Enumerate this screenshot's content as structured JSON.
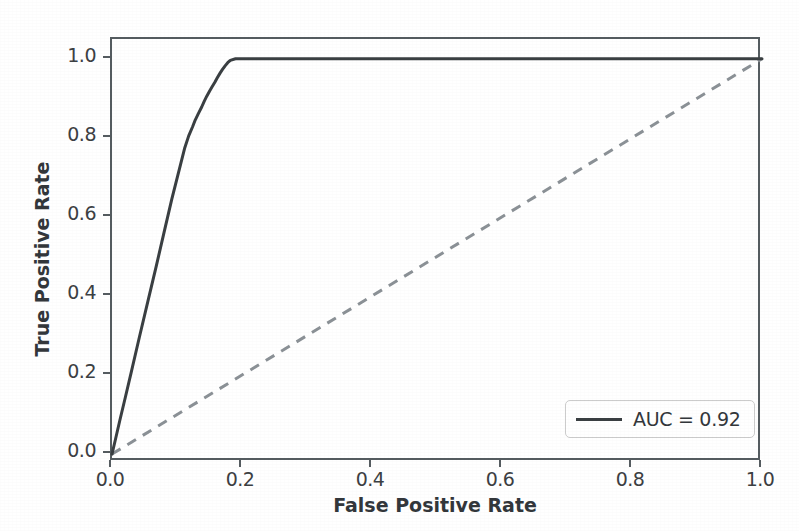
{
  "chart_data": {
    "type": "line",
    "title": "",
    "xlabel": "False Positive Rate",
    "ylabel": "True Positive Rate",
    "xlim": [
      0.0,
      1.0
    ],
    "ylim": [
      -0.02,
      1.05
    ],
    "grid": false,
    "legend_position": "lower right",
    "xticks": [
      "0.0",
      "0.2",
      "0.4",
      "0.6",
      "0.8",
      "1.0"
    ],
    "xtick_values": [
      0.0,
      0.2,
      0.4,
      0.6,
      0.8,
      1.0
    ],
    "yticks": [
      "0.0",
      "0.2",
      "0.4",
      "0.6",
      "0.8",
      "1.0"
    ],
    "ytick_values": [
      0.0,
      0.2,
      0.4,
      0.6,
      0.8,
      1.0
    ],
    "annotations": [],
    "series": [
      {
        "name": "AUC = 0.92",
        "style": "solid",
        "color": "#3a3f42",
        "linewidth": 3,
        "x": [
          0.0,
          0.005,
          0.012,
          0.02,
          0.03,
          0.042,
          0.055,
          0.068,
          0.08,
          0.092,
          0.102,
          0.112,
          0.118,
          0.124,
          0.128,
          0.133,
          0.138,
          0.142,
          0.146,
          0.15,
          0.154,
          0.158,
          0.162,
          0.166,
          0.17,
          0.174,
          0.178,
          0.182,
          0.19,
          0.21,
          0.25,
          0.32,
          0.42,
          0.55,
          0.7,
          0.85,
          1.0
        ],
        "y": [
          0.0,
          0.035,
          0.085,
          0.14,
          0.21,
          0.295,
          0.385,
          0.475,
          0.56,
          0.645,
          0.71,
          0.775,
          0.805,
          0.828,
          0.845,
          0.862,
          0.878,
          0.893,
          0.906,
          0.918,
          0.929,
          0.94,
          0.952,
          0.963,
          0.973,
          0.982,
          0.99,
          0.996,
          1.0,
          1.0,
          1.0,
          1.0,
          1.0,
          1.0,
          1.0,
          1.0,
          1.0
        ]
      },
      {
        "name": "chance-diagonal",
        "style": "dashed",
        "color": "#8b9196",
        "linewidth": 3,
        "x": [
          0.0,
          1.0
        ],
        "y": [
          0.0,
          1.0
        ]
      }
    ]
  },
  "legend": {
    "entries": [
      {
        "label": "AUC = 0.92",
        "color": "#3a3f42",
        "style": "solid"
      }
    ]
  },
  "axes": {
    "frame_color": "#555c60"
  }
}
